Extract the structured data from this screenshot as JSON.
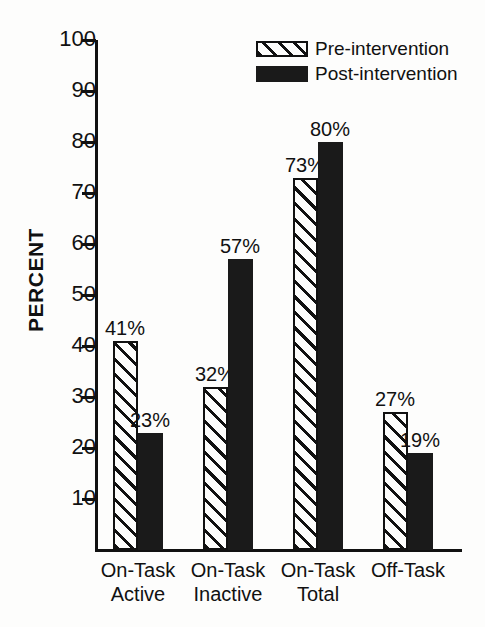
{
  "chart_data": {
    "type": "bar",
    "title": "",
    "xlabel": "",
    "ylabel": "PERCENT",
    "ylim": [
      0,
      100
    ],
    "ytick_step": 10,
    "yticks": [
      100,
      90,
      80,
      70,
      60,
      50,
      40,
      30,
      20,
      10
    ],
    "grid": false,
    "legend_position": "top-right",
    "categories": [
      {
        "line1": "On-Task",
        "line2": "Active"
      },
      {
        "line1": "On-Task",
        "line2": "Inactive"
      },
      {
        "line1": "On-Task",
        "line2": "Total"
      },
      {
        "line1": "Off-Task",
        "line2": ""
      }
    ],
    "series": [
      {
        "name": "Pre-intervention",
        "fill": "diagonal-hatch",
        "values": [
          41,
          32,
          73,
          27
        ],
        "labels": [
          "41%",
          "32%",
          "73%",
          "27%"
        ]
      },
      {
        "name": "Post-intervention",
        "fill": "solid-black",
        "values": [
          23,
          57,
          80,
          19
        ],
        "labels": [
          "23%",
          "57%",
          "80%",
          "19%"
        ]
      }
    ]
  },
  "legend": {
    "items": [
      {
        "label": "Pre-intervention",
        "swatch": "hatched-swatch"
      },
      {
        "label": "Post-intervention",
        "swatch": "solid-swatch"
      }
    ]
  },
  "colors": {
    "ink": "#111111",
    "paper": "#fdfdfc",
    "bar_solid": "#1a1a1a"
  }
}
